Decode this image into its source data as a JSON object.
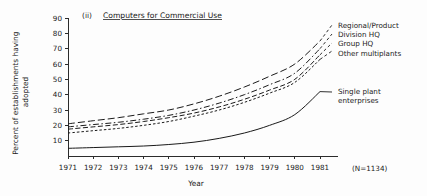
{
  "figure": {
    "panel_tag": "(ii)",
    "title": "Computers for Commercial Use",
    "sample_note": "(N=1134)"
  },
  "chart_data": {
    "type": "line",
    "title": "Computers for Commercial Use",
    "xlabel": "Year",
    "ylabel": "Percent of establishments having adopted",
    "x": [
      1971,
      1972,
      1973,
      1974,
      1975,
      1976,
      1977,
      1978,
      1979,
      1980,
      1981
    ],
    "xlim": [
      1971,
      1981
    ],
    "ylim": [
      0,
      90
    ],
    "yticks": [
      10,
      20,
      30,
      40,
      50,
      60,
      70,
      80,
      90
    ],
    "xticks": [
      "1971",
      "1972",
      "1973",
      "1974",
      "1975",
      "1976",
      "1977",
      "1978",
      "1979",
      "1980",
      "1981"
    ],
    "grid": false,
    "legend_position": "right",
    "series": [
      {
        "name": "Regional/Product",
        "dash": "long-dash",
        "values": [
          21,
          23,
          25,
          27.5,
          30,
          34,
          39,
          45,
          52,
          60,
          75
        ]
      },
      {
        "name": "Division HQ",
        "dash": "dash-dot",
        "values": [
          19,
          20.5,
          22,
          24,
          26.5,
          30,
          34.5,
          40,
          46.5,
          54,
          70
        ]
      },
      {
        "name": "Group HQ",
        "dash": "medium-dash",
        "values": [
          17.5,
          19,
          20.5,
          22.5,
          25,
          28,
          32,
          37,
          43,
          50,
          66
        ]
      },
      {
        "name": "Other multiplants",
        "dash": "short-dash",
        "values": [
          15,
          16.5,
          18,
          20,
          22.5,
          26,
          30,
          35,
          41,
          48,
          63
        ]
      },
      {
        "name": "Single plant enterprises",
        "dash": "solid",
        "values": [
          5,
          5.5,
          6,
          6.5,
          7.5,
          9,
          11.5,
          15,
          20,
          27,
          42
        ]
      }
    ],
    "legend_groups": [
      {
        "labels": [
          "Regional/Product",
          "Division HQ",
          "Group HQ",
          "Other multiplants"
        ]
      },
      {
        "labels": [
          "Single plant",
          "enterprises"
        ]
      }
    ]
  }
}
